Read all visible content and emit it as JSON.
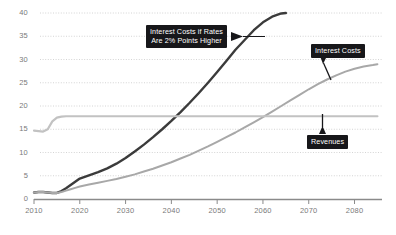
{
  "chart_data": {
    "type": "line",
    "title": "",
    "subtitle": "",
    "xlabel": "",
    "ylabel": "",
    "xlim": [
      2010,
      2086
    ],
    "ylim": [
      0,
      40
    ],
    "grid": "horizontal-dotted",
    "legend_position": "inline-callouts",
    "y_ticks": [
      0,
      5,
      10,
      15,
      20,
      25,
      30,
      35,
      40
    ],
    "y_tick_labels": [
      "0",
      "5",
      "10",
      "15",
      "20",
      "25",
      "30",
      "35",
      "40"
    ],
    "x_ticks": [
      2010,
      2020,
      2030,
      2040,
      2050,
      2060,
      2070,
      2080
    ],
    "x_tick_labels": [
      "2010",
      "2020",
      "2030",
      "2040",
      "2050",
      "2060",
      "2070",
      "2080"
    ],
    "series": [
      {
        "name": "Interest Costs if Rates Are 2% Points Higher",
        "color": "#3b3b3b",
        "x": [
          2010,
          2011,
          2012,
          2013,
          2014,
          2015,
          2016,
          2017,
          2018,
          2019,
          2020,
          2022,
          2024,
          2026,
          2028,
          2030,
          2032,
          2034,
          2036,
          2038,
          2040,
          2042,
          2044,
          2046,
          2048,
          2050,
          2052,
          2054,
          2056,
          2058,
          2060,
          2062,
          2064,
          2065
        ],
        "values": [
          1.4,
          1.5,
          1.5,
          1.4,
          1.3,
          1.3,
          1.7,
          2.3,
          3.0,
          3.7,
          4.4,
          5.1,
          5.8,
          6.6,
          7.6,
          8.8,
          10.2,
          11.7,
          13.3,
          15.0,
          16.8,
          18.7,
          20.7,
          22.8,
          25.0,
          27.3,
          29.7,
          32.1,
          34.2,
          36.3,
          38.0,
          39.2,
          39.9,
          40.0
        ]
      },
      {
        "name": "Interest Costs",
        "color": "#a8a8a8",
        "x": [
          2010,
          2011,
          2012,
          2013,
          2014,
          2015,
          2016,
          2017,
          2018,
          2019,
          2020,
          2022,
          2024,
          2026,
          2028,
          2030,
          2032,
          2034,
          2036,
          2038,
          2040,
          2042,
          2044,
          2046,
          2048,
          2050,
          2052,
          2054,
          2056,
          2058,
          2060,
          2062,
          2064,
          2066,
          2068,
          2070,
          2072,
          2074,
          2076,
          2078,
          2080,
          2082,
          2084,
          2085
        ],
        "values": [
          1.4,
          1.5,
          1.5,
          1.4,
          1.3,
          1.3,
          1.5,
          1.8,
          2.1,
          2.4,
          2.7,
          3.1,
          3.5,
          3.9,
          4.3,
          4.8,
          5.3,
          5.9,
          6.5,
          7.2,
          7.9,
          8.7,
          9.5,
          10.4,
          11.3,
          12.3,
          13.3,
          14.3,
          15.4,
          16.5,
          17.6,
          18.8,
          20.0,
          21.2,
          22.4,
          23.6,
          24.7,
          25.7,
          26.6,
          27.4,
          28.0,
          28.5,
          28.8,
          29.0
        ]
      },
      {
        "name": "Revenues",
        "color": "#c2c2c2",
        "x": [
          2010,
          2011,
          2012,
          2013,
          2014,
          2015,
          2016,
          2017,
          2018,
          2020,
          2025,
          2030,
          2035,
          2040,
          2045,
          2050,
          2055,
          2060,
          2065,
          2070,
          2075,
          2080,
          2085
        ],
        "values": [
          14.7,
          14.6,
          14.5,
          15.0,
          16.7,
          17.5,
          17.7,
          17.8,
          17.8,
          17.8,
          17.8,
          17.8,
          17.8,
          17.8,
          17.8,
          17.8,
          17.8,
          17.8,
          17.8,
          17.8,
          17.8,
          17.8,
          17.8
        ]
      }
    ],
    "annotations": [
      {
        "id": "annotation-rates-higher",
        "text": "Interest Costs if Rates\nAre 2% Points Higher",
        "target_series": "Interest Costs if Rates Are 2% Points Higher"
      },
      {
        "id": "annotation-interest-costs",
        "text": "Interest Costs",
        "target_series": "Interest Costs"
      },
      {
        "id": "annotation-revenues",
        "text": "Revenues",
        "target_series": "Revenues"
      }
    ],
    "colors": {
      "background": "#ffffff",
      "gridline": "#c9c9c9",
      "axis": "#8a8a8a",
      "tick_label": "#7a7a7a",
      "callout_background": "#17171a",
      "callout_text": "#ffffff"
    }
  }
}
